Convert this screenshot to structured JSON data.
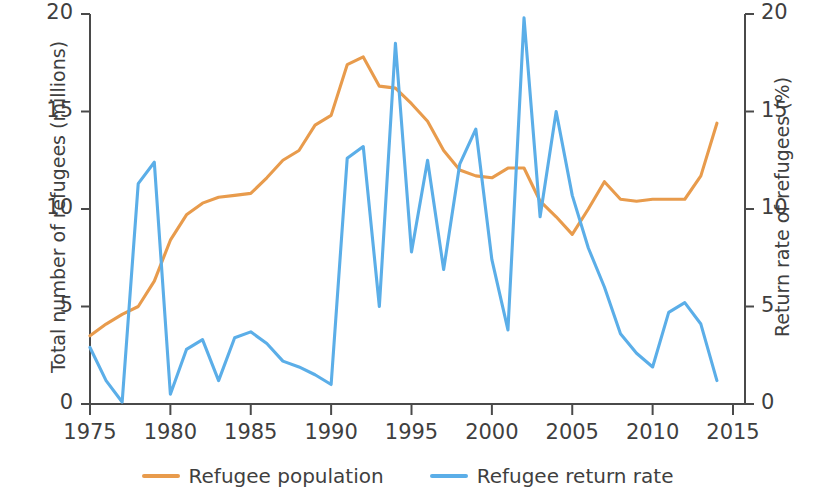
{
  "chart_data": {
    "type": "line",
    "title": "",
    "xlabel": "",
    "ylabel": "Total number of refugees (millions)",
    "y2label": "Return rate of refugees (%)",
    "xlim": [
      1974,
      2015.7
    ],
    "ylim": [
      0,
      20
    ],
    "y2lim": [
      0,
      20
    ],
    "grid": false,
    "legend_position": "bottom-center",
    "xticks": [
      1975,
      1980,
      1985,
      1990,
      1995,
      2000,
      2005,
      2010,
      2015
    ],
    "xtick_labels": [
      "1975",
      "1980",
      "1985",
      "1990",
      "1995",
      "2000",
      "2005",
      "2010",
      "2015"
    ],
    "yticks": [
      0,
      5,
      10,
      15,
      20
    ],
    "ytick_labels": [
      "0",
      "5",
      "10",
      "15",
      "20"
    ],
    "y2ticks": [
      0,
      5,
      10,
      15,
      20
    ],
    "y2tick_labels": [
      "0",
      "5",
      "10",
      "15",
      "20"
    ],
    "x": [
      1975,
      1976,
      1977,
      1978,
      1979,
      1980,
      1981,
      1982,
      1983,
      1984,
      1985,
      1986,
      1987,
      1988,
      1989,
      1990,
      1991,
      1992,
      1993,
      1994,
      1995,
      1996,
      1997,
      1998,
      1999,
      2000,
      2001,
      2002,
      2003,
      2004,
      2005,
      2006,
      2007,
      2008,
      2009,
      2010,
      2011,
      2012,
      2013,
      2014
    ],
    "series": [
      {
        "name": "Refugee population",
        "color": "#e89b4c",
        "axis": "left",
        "units": "millions",
        "values": [
          3.5,
          4.1,
          4.6,
          5.0,
          6.3,
          8.4,
          9.7,
          10.3,
          10.6,
          10.7,
          10.8,
          11.6,
          12.5,
          13.0,
          14.3,
          14.8,
          17.4,
          17.8,
          16.3,
          16.2,
          15.4,
          14.5,
          13.0,
          12.0,
          11.7,
          11.6,
          12.1,
          12.1,
          10.4,
          9.6,
          8.7,
          10.0,
          11.4,
          10.5,
          10.4,
          10.5,
          10.5,
          10.5,
          11.7,
          14.4
        ]
      },
      {
        "name": "Refugee return rate",
        "color": "#5baee8",
        "axis": "right",
        "units": "%",
        "values": [
          2.9,
          1.2,
          0.1,
          11.3,
          12.4,
          0.5,
          2.8,
          3.3,
          1.2,
          3.4,
          3.7,
          3.1,
          2.2,
          1.9,
          1.5,
          1.0,
          12.6,
          13.2,
          5.0,
          18.5,
          7.8,
          12.5,
          6.9,
          12.3,
          14.1,
          7.4,
          3.8,
          19.8,
          9.6,
          15.0,
          10.7,
          8.0,
          6.0,
          3.6,
          2.6,
          1.9,
          4.7,
          5.2,
          4.1,
          1.2
        ]
      }
    ]
  },
  "legend": {
    "entries": [
      {
        "label": "Refugee population",
        "color": "#e89b4c"
      },
      {
        "label": "Refugee return rate",
        "color": "#5baee8"
      }
    ]
  },
  "axes": {
    "left_title": "Total number of refugees (millions)",
    "right_title": "Return rate of refugees (%)"
  }
}
